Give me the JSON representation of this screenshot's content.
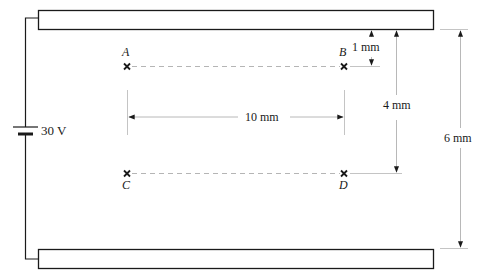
{
  "diagram": {
    "battery": {
      "label": "30 V"
    },
    "points": [
      {
        "id": "A",
        "label": "A"
      },
      {
        "id": "B",
        "label": "B"
      },
      {
        "id": "C",
        "label": "C"
      },
      {
        "id": "D",
        "label": "D"
      }
    ],
    "dimensions": {
      "horizontal_AB": "10 mm",
      "plate_to_AB": "1 mm",
      "plate_to_CD": "4 mm",
      "plate_separation": "6 mm"
    },
    "colors": {
      "line": "#1a1a1a",
      "guide": "#b0b0b0",
      "background": "#ffffff"
    }
  }
}
